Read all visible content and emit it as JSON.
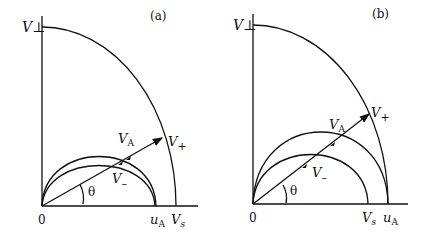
{
  "figure": {
    "panels": [
      {
        "id": "a",
        "label": "(a)",
        "axis_y_label": "V⊥",
        "origin_label": "0",
        "x_ticks": [
          {
            "label_main": "u",
            "label_sub": "A"
          },
          {
            "label_main": "V",
            "label_sub": "s"
          }
        ],
        "curve_labels": {
          "fast_main": "V",
          "fast_sub": "+",
          "alfven_main": "V",
          "alfven_sub": "A",
          "slow_main": "V",
          "slow_sub": "–"
        },
        "angle_label": "θ",
        "condition": "u_A < V_s"
      },
      {
        "id": "b",
        "label": "(b)",
        "axis_y_label": "V⊥",
        "origin_label": "0",
        "x_ticks": [
          {
            "label_main": "V",
            "label_sub": "s"
          },
          {
            "label_main": "u",
            "label_sub": "A"
          }
        ],
        "curve_labels": {
          "fast_main": "V",
          "fast_sub": "+",
          "alfven_main": "V",
          "alfven_sub": "A",
          "slow_main": "V",
          "slow_sub": "–"
        },
        "angle_label": "θ",
        "condition": "V_s < u_A"
      }
    ]
  }
}
